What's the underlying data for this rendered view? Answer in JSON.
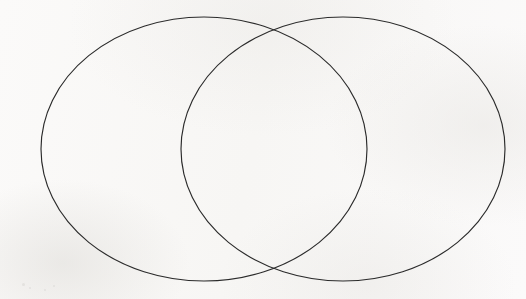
{
  "document": {
    "kind": "venn-diagram",
    "title": "Two-set Venn diagram",
    "caption": "",
    "width": 526,
    "height": 299,
    "background_color": "#f9f8f6",
    "stroke_color": "#2b2b2b",
    "stroke_width": 1.15,
    "fill": "none",
    "label_text": ""
  },
  "chart_data": {
    "type": "venn",
    "title": "",
    "subtitle": "",
    "xlabel": "",
    "ylabel": "",
    "legend": [],
    "annotations": [],
    "grid": false,
    "set_count": 2,
    "labels_visible": false,
    "counts_visible": false,
    "sets": [
      {
        "name": "left-set",
        "label": "",
        "count": null,
        "center_x": 204,
        "center_y": 149,
        "radius_x": 163,
        "radius_y": 132,
        "fill": "none",
        "stroke": "#2b2b2b"
      },
      {
        "name": "right-set",
        "label": "",
        "count": null,
        "center_x": 343,
        "center_y": 149,
        "radius_x": 162,
        "radius_y": 132,
        "fill": "none",
        "stroke": "#2b2b2b"
      }
    ],
    "regions": [
      {
        "name": "left-only",
        "label": "",
        "count": null
      },
      {
        "name": "intersection",
        "label": "",
        "count": null
      },
      {
        "name": "right-only",
        "label": "",
        "count": null
      }
    ],
    "intersection_points": [
      {
        "x": 276,
        "y": 30
      },
      {
        "x": 276,
        "y": 268
      }
    ],
    "extents": {
      "left_edge": 41,
      "right_edge": 505,
      "top_edge": 17,
      "bottom_edge": 281
    }
  },
  "artifacts": {
    "speckles": [
      {
        "x": 22,
        "y": 283,
        "size": 3
      },
      {
        "x": 29,
        "y": 287,
        "size": 2
      },
      {
        "x": 44,
        "y": 289,
        "size": 2
      },
      {
        "x": 53,
        "y": 285,
        "size": 2
      }
    ]
  }
}
